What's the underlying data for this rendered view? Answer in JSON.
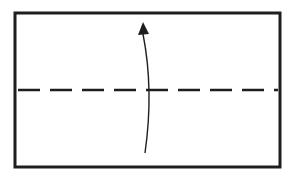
{
  "diagram": {
    "type": "origami-fold-step",
    "canvas": {
      "width": 293,
      "height": 179,
      "background": "#ffffff"
    },
    "stroke_color": "#1e1e1e",
    "paper": {
      "shape": "rectangle",
      "x": 15,
      "y": 13,
      "width": 265,
      "height": 154,
      "stroke_width": 3,
      "fill": "#ffffff"
    },
    "fold_line": {
      "style": "dashed",
      "kind": "valley-fold",
      "x1": 18,
      "y1": 90,
      "x2": 278,
      "y2": 90,
      "stroke_width": 2.5,
      "dash": "22 10"
    },
    "arrow": {
      "direction": "up",
      "meaning": "fold bottom edge up to top edge",
      "start": {
        "x": 145,
        "y": 153
      },
      "control": {
        "x": 154,
        "y": 90
      },
      "end": {
        "x": 143,
        "y": 34
      },
      "stroke_width": 1.4,
      "head": {
        "tip_x": 143,
        "tip_y": 22,
        "left_x": 138,
        "left_y": 35,
        "right_x": 149,
        "right_y": 34
      }
    }
  }
}
